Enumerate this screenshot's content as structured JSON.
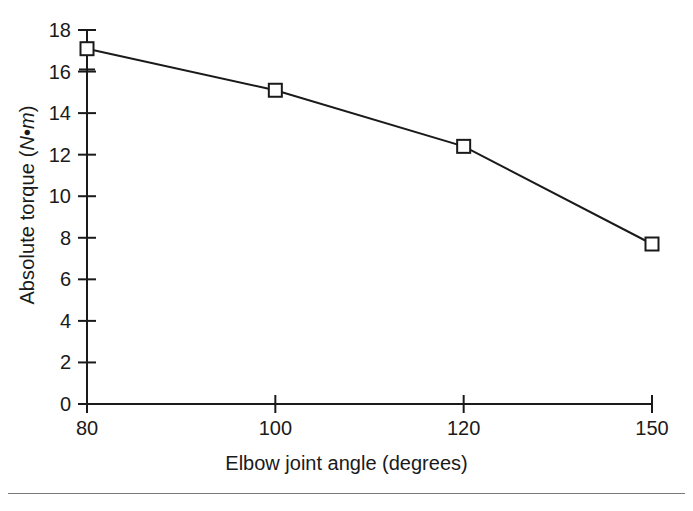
{
  "chart_data": {
    "type": "line",
    "title": "",
    "subtitle": "",
    "xlabel": "Elbow joint angle (degrees)",
    "ylabel_text": "Absolute torque (N • m)",
    "ylabel_parts": {
      "prefix": "Absolute torque (",
      "symbol_n": "N",
      "operator": " • ",
      "symbol_m": "m",
      "suffix": ")"
    },
    "categories": [
      "80",
      "100",
      "120",
      "150"
    ],
    "x_tick_labels": [
      "80",
      "100",
      "120",
      "150"
    ],
    "y_tick_labels": [
      "0",
      "2",
      "4",
      "6",
      "8",
      "10",
      "12",
      "14",
      "16",
      "18"
    ],
    "y_ticks": [
      0,
      2,
      4,
      6,
      8,
      10,
      12,
      14,
      16,
      18
    ],
    "ylim": [
      0,
      18
    ],
    "values": [
      17.1,
      15.1,
      12.4,
      7.7
    ],
    "errors": [
      1.0,
      0,
      0,
      0
    ],
    "error_bars": [
      {
        "category": "80",
        "value": 17.1,
        "low": 16.1,
        "high": 18.0
      },
      {
        "category": "100",
        "value": 15.1,
        "low": 15.1,
        "high": 15.1
      },
      {
        "category": "120",
        "value": 12.4,
        "low": 12.4,
        "high": 12.4
      },
      {
        "category": "150",
        "value": 7.7,
        "low": 7.7,
        "high": 7.7
      }
    ],
    "series": [
      {
        "name": "Absolute torque",
        "marker": "open-square",
        "values": [
          17.1,
          15.1,
          12.4,
          7.7
        ]
      }
    ],
    "grid": false,
    "legend": false,
    "legend_position": "none",
    "annotations": []
  },
  "style": {
    "axis_color": "#1a1a1a",
    "line_color": "#1a1a1a",
    "marker_fill": "#ffffff",
    "marker_stroke": "#1a1a1a",
    "background": "#ffffff",
    "footer_rule_color": "#7a7a7a"
  }
}
